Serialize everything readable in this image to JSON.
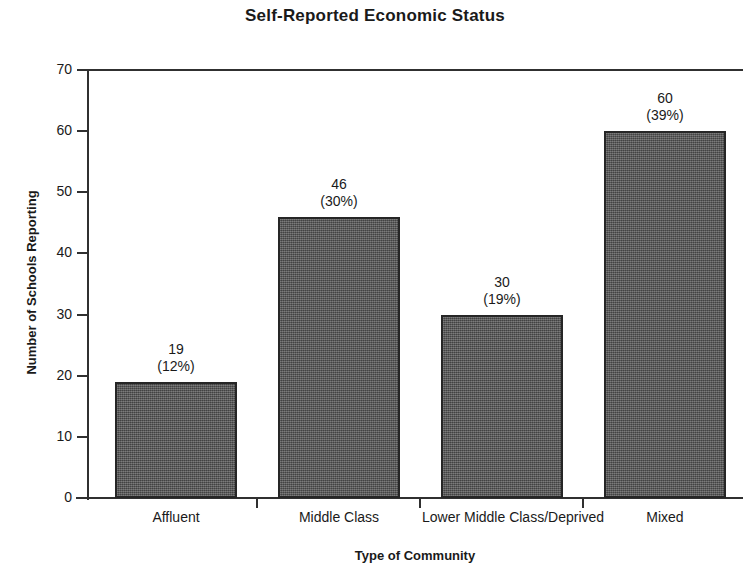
{
  "chart_data": {
    "type": "bar",
    "title": "Self-Reported Economic Status",
    "xlabel": "Type of Community",
    "ylabel": "Number of Schools Reporting",
    "categories": [
      "Affluent",
      "Middle Class",
      "Lower Middle Class/Deprived",
      "Mixed"
    ],
    "values": [
      19,
      46,
      30,
      60
    ],
    "percent_labels": [
      "(12%)",
      "(30%)",
      "(19%)",
      "(39%)"
    ],
    "percents": [
      12,
      30,
      19,
      39
    ],
    "value_labels": [
      "19",
      "46",
      "30",
      "60"
    ],
    "ylim": [
      0,
      70
    ],
    "yticks": [
      0,
      10,
      20,
      30,
      40,
      50,
      60,
      70
    ],
    "ytick_labels": [
      "0",
      "10",
      "20",
      "30",
      "40",
      "50",
      "60",
      "70"
    ],
    "grid": false,
    "legend": "none",
    "bar_color": "#545454",
    "bar_edge_color": "#262626",
    "axis_color": "#303030",
    "background_color": "#ffffff"
  }
}
